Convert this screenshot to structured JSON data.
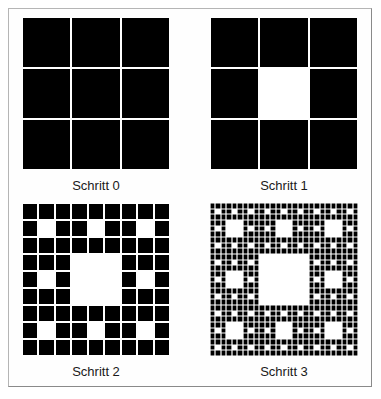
{
  "figure": {
    "panels": [
      {
        "id": "step0",
        "label": "Schritt 0",
        "level": 0,
        "grid_size": 3,
        "x": 22,
        "y": 17
      },
      {
        "id": "step1",
        "label": "Schritt 1",
        "level": 1,
        "grid_size": 3,
        "x": 210,
        "y": 17
      },
      {
        "id": "step2",
        "label": "Schritt 2",
        "level": 2,
        "grid_size": 9,
        "x": 22,
        "y": 203
      },
      {
        "id": "step3",
        "label": "Schritt 3",
        "level": 3,
        "grid_size": 27,
        "x": 210,
        "y": 203
      }
    ],
    "colors": {
      "filled": "#000000",
      "empty": "#ffffff",
      "grid_line": "#ffffff",
      "border": "#8a8a8a"
    }
  }
}
